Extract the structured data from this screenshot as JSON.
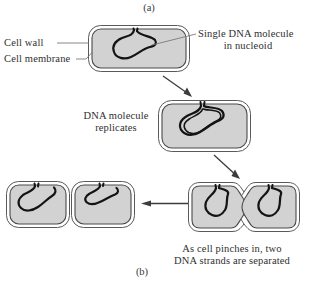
{
  "figure": {
    "panel_a_label": "(a)",
    "panel_b_label": "(b)",
    "labels": {
      "cell_wall": "Cell wall",
      "cell_membrane": "Cell membrane",
      "single_dna_line1": "Single DNA molecule",
      "single_dna_line2": "in nucleoid",
      "replicates_line1": "DNA molecule",
      "replicates_line2": "replicates",
      "pinches_line1": "As cell pinches in, two",
      "pinches_line2": "DNA strands are separated"
    },
    "colors": {
      "cytoplasm_fill": "#d2d2d2",
      "outline": "#4a4a4a",
      "dna_stroke": "#1a1a1a",
      "text": "#2f2f2f",
      "leader_line": "#6b6b6b",
      "background": "#ffffff"
    },
    "cells": [
      {
        "name": "parent-cell",
        "stage": "single DNA molecule in nucleoid",
        "x": 88,
        "y": 25,
        "w": 102,
        "h": 47
      },
      {
        "name": "replicated-cell",
        "stage": "DNA molecule replicates",
        "x": 158,
        "y": 100,
        "w": 93,
        "h": 52
      },
      {
        "name": "dividing-cell",
        "stage": "cell pinches in, two DNA strands separated",
        "x": 188,
        "y": 182,
        "w": 112,
        "h": 50
      },
      {
        "name": "daughter-cell-left",
        "stage": "separated daughter cell",
        "x": 6,
        "y": 181,
        "w": 64,
        "h": 47
      },
      {
        "name": "daughter-cell-right",
        "stage": "separated daughter cell",
        "x": 71,
        "y": 181,
        "w": 64,
        "h": 47
      }
    ],
    "arrows": [
      {
        "name": "arrow-parent-to-replicated",
        "from": [
          163,
          76
        ],
        "to": [
          192,
          97
        ]
      },
      {
        "name": "arrow-replicated-to-dividing",
        "from": [
          215,
          156
        ],
        "to": [
          240,
          179
        ]
      },
      {
        "name": "arrow-dividing-to-daughters",
        "from": [
          188,
          203
        ],
        "to": [
          142,
          203
        ]
      }
    ],
    "leaders": [
      {
        "name": "leader-cell-wall",
        "from": [
          58,
          43
        ],
        "to": [
          90,
          43
        ]
      },
      {
        "name": "leader-cell-membrane",
        "from": [
          76,
          59
        ],
        "to": [
          92,
          52
        ]
      },
      {
        "name": "leader-single-dna",
        "from": [
          196,
          34
        ],
        "to": [
          152,
          44
        ]
      }
    ]
  }
}
